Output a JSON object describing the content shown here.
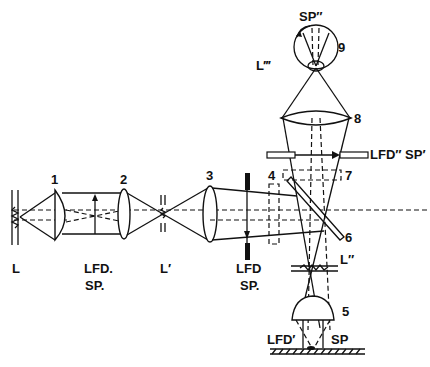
{
  "diagram": {
    "type": "optical-path-schematic",
    "labels": {
      "lamp": "L",
      "lamp_image_1": "L′",
      "lamp_image_2": "L″",
      "lamp_image_3": "L‴",
      "field_diaphragm_1": "LFD",
      "field_diaphragm_1b": "SP",
      "field_diaphragm_2": "LFD′",
      "specimen": "SP",
      "field_diaphragm_3": "LFD″ SP′",
      "collector_plane_1": "LFD",
      "collector_plane_1b": "SP",
      "eye_retina": "SP″"
    },
    "components": [
      {
        "number": "1",
        "name": "collector-lens"
      },
      {
        "number": "2",
        "name": "lens-2"
      },
      {
        "number": "3",
        "name": "lens-3"
      },
      {
        "number": "4",
        "name": "filter"
      },
      {
        "number": "5",
        "name": "objective"
      },
      {
        "number": "6",
        "name": "beam-splitter"
      },
      {
        "number": "7",
        "name": "filter-2"
      },
      {
        "number": "8",
        "name": "eyepiece"
      },
      {
        "number": "9",
        "name": "eye"
      }
    ]
  }
}
